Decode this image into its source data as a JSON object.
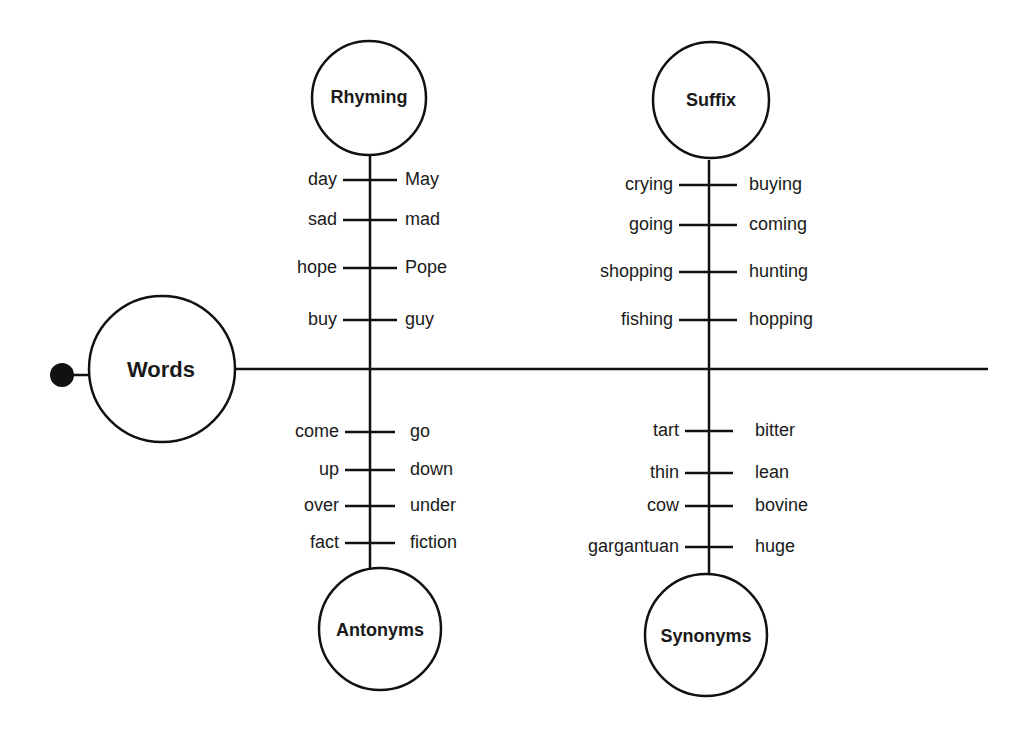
{
  "diagram": {
    "root": {
      "label": "Words"
    },
    "branches": [
      {
        "label": "Rhyming",
        "pairs": [
          [
            "day",
            "May"
          ],
          [
            "sad",
            "mad"
          ],
          [
            "hope",
            "Pope"
          ],
          [
            "buy",
            "guy"
          ]
        ]
      },
      {
        "label": "Suffix",
        "pairs": [
          [
            "crying",
            "buying"
          ],
          [
            "going",
            "coming"
          ],
          [
            "shopping",
            "hunting"
          ],
          [
            "fishing",
            "hopping"
          ]
        ]
      },
      {
        "label": "Antonyms",
        "pairs": [
          [
            "come",
            "go"
          ],
          [
            "up",
            "down"
          ],
          [
            "over",
            "under"
          ],
          [
            "fact",
            "fiction"
          ]
        ]
      },
      {
        "label": "Synonyms",
        "pairs": [
          [
            "tart",
            "bitter"
          ],
          [
            "thin",
            "lean"
          ],
          [
            "cow",
            "bovine"
          ],
          [
            "gargantuan",
            "huge"
          ]
        ]
      }
    ]
  }
}
